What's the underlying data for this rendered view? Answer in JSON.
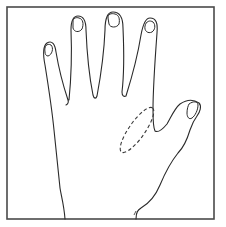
{
  "figure": {
    "colors": {
      "background": "#ffffff",
      "frame": "#4a4a4a",
      "line": "#2a2a2a",
      "dashed_marker": "#3a3a3a"
    },
    "marked_region": "thenar-area-dashed-ellipse"
  }
}
